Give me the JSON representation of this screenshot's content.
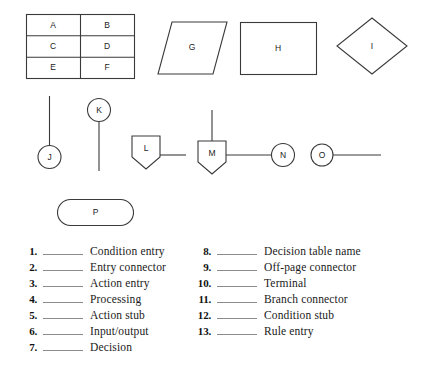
{
  "diagram": {
    "title_hidden": "Flowchart and decision table symbol identification exercise",
    "decision_table": {
      "name": "decision-table",
      "cells": [
        [
          "A",
          "B"
        ],
        [
          "C",
          "D"
        ],
        [
          "E",
          "F"
        ]
      ],
      "x": 26,
      "y": 14,
      "width": 108,
      "height": 64
    },
    "shapes": [
      {
        "id": "parallelogram-g",
        "label": "G",
        "kind": "parallelogram"
      },
      {
        "id": "rectangle-h",
        "label": "H",
        "kind": "rectangle"
      },
      {
        "id": "diamond-i",
        "label": "I",
        "kind": "diamond"
      },
      {
        "id": "circle-j",
        "label": "J",
        "kind": "circle"
      },
      {
        "id": "circle-k",
        "label": "K",
        "kind": "circle"
      },
      {
        "id": "pentagon-l",
        "label": "L",
        "kind": "pentagon-down"
      },
      {
        "id": "pentagon-m",
        "label": "M",
        "kind": "pentagon-down"
      },
      {
        "id": "circle-n",
        "label": "N",
        "kind": "circle"
      },
      {
        "id": "circle-o",
        "label": "O",
        "kind": "circle"
      },
      {
        "id": "terminal-p",
        "label": "P",
        "kind": "stadium"
      }
    ],
    "stroke_color": "#3a3a3a",
    "fill_color": "#ffffff"
  },
  "answer_list": {
    "left_column": [
      {
        "number": "1.",
        "text": "Condition entry"
      },
      {
        "number": "2.",
        "text": "Entry connector"
      },
      {
        "number": "3.",
        "text": "Action entry"
      },
      {
        "number": "4.",
        "text": "Processing"
      },
      {
        "number": "5.",
        "text": "Action stub"
      },
      {
        "number": "6.",
        "text": "Input/output"
      },
      {
        "number": "7.",
        "text": "Decision"
      }
    ],
    "right_column": [
      {
        "number": "8.",
        "text": "Decision table name"
      },
      {
        "number": "9.",
        "text": "Off-page connector"
      },
      {
        "number": "10.",
        "text": "Terminal"
      },
      {
        "number": "11.",
        "text": "Branch connector"
      },
      {
        "number": "12.",
        "text": "Condition stub"
      },
      {
        "number": "13.",
        "text": "Rule entry"
      }
    ]
  }
}
